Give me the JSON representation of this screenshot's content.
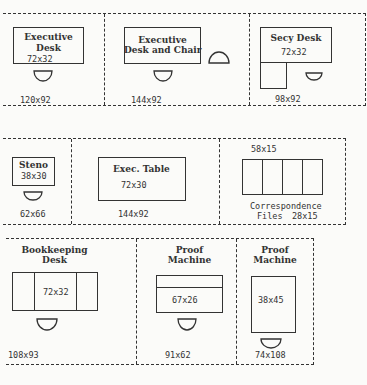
{
  "rows": [
    {
      "stations": [
        {
          "name": "Executive Desk",
          "label_lines": [
            "Executive",
            "Desk"
          ],
          "furniture_size": "72x32",
          "area": "120x92"
        },
        {
          "name": "Executive Desk and Chair",
          "label_lines": [
            "Executive",
            "Desk and Chair"
          ],
          "area": "144x92"
        },
        {
          "name": "Secy Desk",
          "label_lines": [
            "Secy Desk"
          ],
          "furniture_size": "72x32",
          "area": "98x92"
        }
      ]
    },
    {
      "stations": [
        {
          "name": "Steno",
          "label_lines": [
            "Steno"
          ],
          "furniture_size": "38x30",
          "area": "62x66"
        },
        {
          "name": "Exec. Table",
          "label_lines": [
            "Exec. Table"
          ],
          "furniture_size": "72x30",
          "area": "144x92"
        },
        {
          "name": "Correspondence Files",
          "label_lines": [
            "Correspondence",
            "Files"
          ],
          "furniture_size": "28x15",
          "overall_size": "58x15"
        }
      ]
    },
    {
      "stations": [
        {
          "name": "Bookkeeping Desk",
          "label_lines": [
            "Bookkeeping",
            "Desk"
          ],
          "furniture_size": "72x32",
          "area": "108x93"
        },
        {
          "name": "Proof Machine",
          "label_lines": [
            "Proof",
            "Machine"
          ],
          "furniture_size": "67x26",
          "area": "91x62"
        },
        {
          "name": "Proof Machine",
          "label_lines": [
            "Proof",
            "Machine"
          ],
          "furniture_size": "38x45",
          "area": "74x108"
        }
      ]
    }
  ]
}
